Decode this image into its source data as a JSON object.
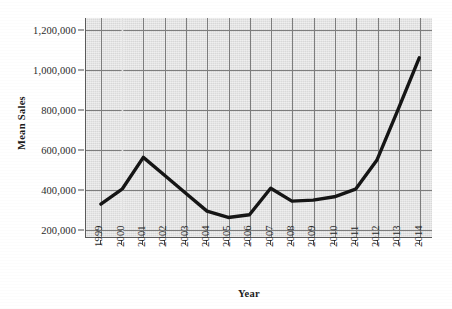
{
  "chart_data": {
    "type": "line",
    "title": "",
    "subtitle": "",
    "xlabel": "Year",
    "ylabel": "Mean Sales",
    "x": [
      1999,
      2000,
      2001,
      2002,
      2003,
      2004,
      2005,
      2006,
      2007,
      2008,
      2009,
      2010,
      2011,
      2012,
      2013,
      2014
    ],
    "categories": [
      "1999",
      "2000",
      "2001",
      "2002",
      "2003",
      "2004",
      "2005",
      "2006",
      "2007",
      "2008",
      "2009",
      "2010",
      "2011",
      "2012",
      "2013",
      "2014"
    ],
    "values": [
      325000,
      400000,
      560000,
      470000,
      380000,
      290000,
      258000,
      272000,
      405000,
      340000,
      345000,
      362000,
      400000,
      545000,
      800000,
      1060000
    ],
    "series": [
      {
        "name": "Mean Sales",
        "color": "#151515",
        "values": [
          325000,
          400000,
          560000,
          470000,
          380000,
          290000,
          258000,
          272000,
          405000,
          340000,
          345000,
          362000,
          400000,
          545000,
          800000,
          1060000
        ]
      }
    ],
    "ylim": [
      160000,
      1260000
    ],
    "xlim": [
      1998.3,
      2014.6
    ],
    "ytick_values": [
      200000,
      400000,
      600000,
      800000,
      1000000,
      1200000
    ],
    "ytick_labels": [
      "200,000",
      "400,000",
      "600,000",
      "800,000",
      "1,000,000",
      "1,200,000"
    ],
    "grid": true,
    "grid_x": true,
    "grid_y": true,
    "legend": false,
    "legend_position": "none",
    "plot_background": "#e3e3e3",
    "grid_color": "#7d7d7d",
    "line_color": "#151515",
    "line_width": 3.4,
    "markers": false,
    "annotations": []
  },
  "axes": {
    "y_title": "Mean Sales",
    "x_title": "Year"
  }
}
